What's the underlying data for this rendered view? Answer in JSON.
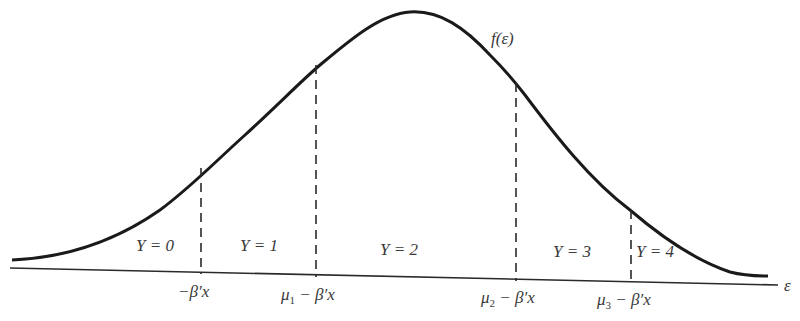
{
  "diagram": {
    "type": "ordered-probit-density",
    "curve_label": "f(ε)",
    "axis_label": "ε",
    "colors": {
      "line": "#1e1e1e",
      "text": "#3a3a3a",
      "background": "#ffffff"
    },
    "regions": [
      {
        "label": "Y = 0"
      },
      {
        "label": "Y = 1"
      },
      {
        "label": "Y = 2"
      },
      {
        "label": "Y = 3"
      },
      {
        "label": "Y = 4"
      }
    ],
    "thresholds": [
      {
        "prefix": "",
        "sub": "",
        "suffix": "−β′x"
      },
      {
        "prefix": "μ",
        "sub": "1",
        "suffix": " − β′x"
      },
      {
        "prefix": "μ",
        "sub": "2",
        "suffix": " − β′x"
      },
      {
        "prefix": "μ",
        "sub": "3",
        "suffix": " − β′x"
      }
    ]
  }
}
